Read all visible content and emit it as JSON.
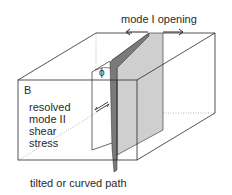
{
  "diagram": {
    "labels": {
      "mode_i_opening": "mode I opening",
      "block": "B",
      "phi": "ϕ",
      "shear_lines": [
        "resolved",
        "mode II",
        "shear",
        "stress"
      ],
      "path": "tilted or curved path"
    },
    "colors": {
      "line": "#2a2a2a",
      "plane_fill": "#cfcfcf",
      "plane_dark": "#7a7a7a",
      "background": "#ffffff"
    }
  }
}
